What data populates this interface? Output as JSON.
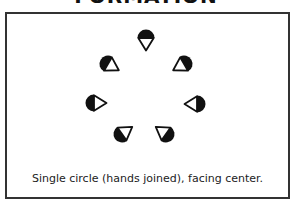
{
  "title": "FORMATION",
  "caption": "Single circle (hands joined), facing center.",
  "diagram": {
    "formation": "single-circle",
    "facing": "center",
    "dancer_count": 7,
    "dancer_symbol": "half-filled circle with triangle pointing in facing direction",
    "colors": {
      "fill": "#111111",
      "stroke": "#111111",
      "background": "#ffffff",
      "frame": "#333333"
    },
    "dancers": [
      {
        "id": 1,
        "x": 146,
        "y": 38,
        "facing_deg": 90
      },
      {
        "id": 2,
        "x": 108,
        "y": 64,
        "facing_deg": 30
      },
      {
        "id": 3,
        "x": 184,
        "y": 64,
        "facing_deg": 150
      },
      {
        "id": 4,
        "x": 94,
        "y": 103,
        "facing_deg": 0
      },
      {
        "id": 5,
        "x": 197,
        "y": 104,
        "facing_deg": 180
      },
      {
        "id": 6,
        "x": 122,
        "y": 134,
        "facing_deg": -35
      },
      {
        "id": 7,
        "x": 166,
        "y": 134,
        "facing_deg": -145
      }
    ]
  }
}
